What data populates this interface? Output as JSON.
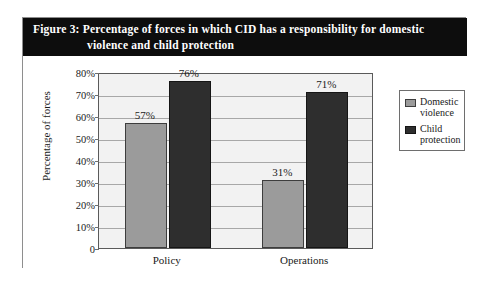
{
  "figure": {
    "caption_line_1": "Figure 3: Percentage of forces in which CID has a responsibility for domestic",
    "caption_line_2": "violence and child protection",
    "caption_bar_color": "#0d0d0d",
    "frame_border_color": "#8e8e8e"
  },
  "chart_data": {
    "type": "bar",
    "title": "Figure 3: Percentage of forces in which CID has a responsibility for domestic violence and child protection",
    "categories": [
      "Policy",
      "Operations"
    ],
    "series": [
      {
        "name": "Domestic violence",
        "legend_line_1": "Domestic",
        "legend_line_2": "violence",
        "color": "#9b9b9b",
        "values": [
          57,
          71
        ],
        "value_labels": [
          "57%",
          "31%"
        ]
      },
      {
        "name": "Child protection",
        "legend_line_1": "Child",
        "legend_line_2": "protection",
        "color": "#2e2e2e",
        "values": [
          76,
          71
        ],
        "value_labels": [
          "76%",
          "71%"
        ]
      }
    ],
    "data_points": [
      {
        "category": "Policy",
        "series": "Domestic violence",
        "value": 57,
        "label": "57%"
      },
      {
        "category": "Policy",
        "series": "Child protection",
        "value": 76,
        "label": "76%"
      },
      {
        "category": "Operations",
        "series": "Domestic violence",
        "value": 31,
        "label": "31%"
      },
      {
        "category": "Operations",
        "series": "Child protection",
        "value": 71,
        "label": "71%"
      }
    ],
    "xlabel": "",
    "ylabel": "Percentage of forces",
    "ylim": [
      0,
      80
    ],
    "ytick_values": [
      0,
      10,
      20,
      30,
      40,
      50,
      60,
      70,
      80
    ],
    "ytick_labels": [
      "0",
      "10%",
      "20%",
      "30%",
      "40%",
      "50%",
      "60%",
      "70%",
      "80%"
    ],
    "grid": true,
    "grid_orientation": "horizontal",
    "legend_position": "right",
    "plot_background": "#f2f2f2"
  }
}
